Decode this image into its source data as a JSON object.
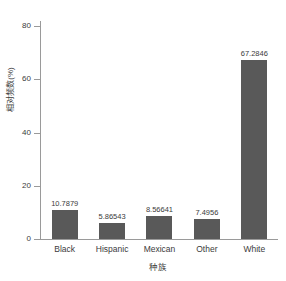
{
  "chart_data": {
    "type": "bar",
    "title": "",
    "subtitle": "",
    "xlabel": "种族",
    "ylabel": "相对频数(%)",
    "categories": [
      "Black",
      "Hispanic",
      "Mexican",
      "Other",
      "White"
    ],
    "values": [
      10.7879,
      5.86543,
      8.56641,
      7.4956,
      67.2846
    ],
    "value_labels": [
      "10.7879",
      "5.86543",
      "8.56641",
      "7.4956",
      "67.2846"
    ],
    "ylim": [
      0,
      82
    ],
    "yticks": [
      0,
      20,
      40,
      60,
      80
    ],
    "ytick_labels": [
      "0",
      "20",
      "40",
      "60",
      "80"
    ],
    "grid": false,
    "legend": null,
    "bar_color": "#595959",
    "axis_color": "#9a9a9a",
    "text_color": "#3b3b3b",
    "background": "#ffffff"
  }
}
